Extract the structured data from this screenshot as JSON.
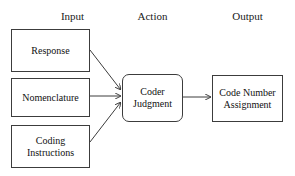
{
  "diagram": {
    "columns": [
      {
        "id": "input",
        "label": "Input"
      },
      {
        "id": "action",
        "label": "Action"
      },
      {
        "id": "output",
        "label": "Output"
      }
    ],
    "nodes": {
      "response": {
        "label": "Response",
        "shape": "rectangle",
        "column": "input"
      },
      "nomenclature": {
        "label": "Nomenclature",
        "shape": "rectangle",
        "column": "input"
      },
      "coding_instructions": {
        "label": "Coding Instructions",
        "shape": "rectangle",
        "column": "input"
      },
      "coder_judgment": {
        "label": "Coder Judgment",
        "shape": "rounded-rectangle",
        "column": "action"
      },
      "code_number_assignment": {
        "label": "Code Number Assignment",
        "shape": "rectangle",
        "column": "output"
      }
    },
    "edges": [
      {
        "id": "response-to-coder",
        "from": "response",
        "to": "coder_judgment",
        "style": "diagonal-arrow"
      },
      {
        "id": "nomenclature-to-coder",
        "from": "nomenclature",
        "to": "coder_judgment",
        "style": "straight-arrow"
      },
      {
        "id": "coding-instructions-to-coder",
        "from": "coding_instructions",
        "to": "coder_judgment",
        "style": "diagonal-arrow"
      },
      {
        "id": "coder-to-output",
        "from": "coder_judgment",
        "to": "code_number_assignment",
        "style": "straight-arrow"
      }
    ],
    "colors": {
      "background": "#ffffff",
      "stroke": "#3c3c3c",
      "text": "#111111",
      "header_text": "#1a1a1a"
    }
  }
}
